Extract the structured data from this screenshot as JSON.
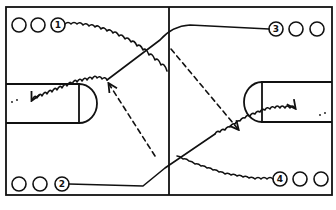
{
  "diagram": {
    "type": "basketball-drill",
    "players": [
      {
        "label": "1",
        "position": "top-left"
      },
      {
        "label": "2",
        "position": "bottom-left"
      },
      {
        "label": "3",
        "position": "top-right"
      },
      {
        "label": "4",
        "position": "bottom-right"
      }
    ],
    "legend": {
      "solid_line": "player cut",
      "wavy_line": "dribble",
      "dashed_line": "pass"
    },
    "colors": {
      "ink": "#111111",
      "background": "#ffffff"
    }
  }
}
